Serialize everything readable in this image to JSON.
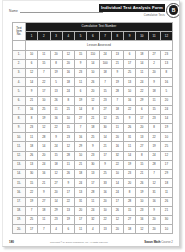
{
  "document": {
    "title": "Individual Test Analysis Form",
    "subtitle": "Cumulative Tests",
    "badge_letter": "B",
    "name_label": "Name"
  },
  "table": {
    "corner_label_line1": "Test",
    "corner_label_line2": "Item",
    "corner_label_line3": "No.",
    "group_header": "Cumulative Test Number",
    "lesson_header": "Lesson Assessed",
    "columns": [
      "1",
      "2",
      "3",
      "4",
      "5",
      "6",
      "7",
      "8",
      "9",
      "10",
      "11",
      "12"
    ],
    "rows": [
      {
        "label": "1.",
        "values": [
          "10",
          "11",
          "20",
          "12",
          "15",
          "110",
          "24",
          "13",
          "6",
          "18",
          "27",
          "23"
        ]
      },
      {
        "label": "2.",
        "values": [
          "6",
          "15",
          "8",
          "20",
          "9",
          "14",
          "100",
          "21",
          "17",
          "14",
          "2",
          "13"
        ]
      },
      {
        "label": "3.",
        "values": [
          "12",
          "7",
          "19",
          "16",
          "23",
          "10",
          "18",
          "9",
          "25",
          "11",
          "20",
          "8"
        ]
      },
      {
        "label": "4.",
        "values": [
          "14",
          "22",
          "5",
          "18",
          "11",
          "26",
          "7",
          "19",
          "13",
          "24",
          "9",
          "16"
        ]
      },
      {
        "label": "5.",
        "values": [
          "9",
          "17",
          "13",
          "24",
          "6",
          "20",
          "15",
          "28",
          "10",
          "22",
          "18",
          "5"
        ]
      },
      {
        "label": "6.",
        "values": [
          "21",
          "10",
          "26",
          "8",
          "19",
          "12",
          "23",
          "7",
          "16",
          "29",
          "11",
          "20"
        ]
      },
      {
        "label": "7.",
        "values": [
          "16",
          "25",
          "11",
          "21",
          "14",
          "8",
          "27",
          "18",
          "22",
          "6",
          "15",
          "24"
        ]
      },
      {
        "label": "8.",
        "values": [
          "8",
          "19",
          "16",
          "10",
          "27",
          "21",
          "12",
          "25",
          "9",
          "17",
          "23",
          "14"
        ]
      },
      {
        "label": "9.",
        "values": [
          "23",
          "12",
          "22",
          "15",
          "7",
          "18",
          "30",
          "11",
          "26",
          "20",
          "8",
          "19"
        ]
      },
      {
        "label": "10.",
        "values": [
          "11",
          "28",
          "9",
          "23",
          "16",
          "25",
          "14",
          "20",
          "31",
          "13",
          "22",
          "10"
        ]
      },
      {
        "label": "11.",
        "values": [
          "18",
          "14",
          "24",
          "12",
          "29",
          "9",
          "21",
          "16",
          "11",
          "27",
          "19",
          "25"
        ]
      },
      {
        "label": "12.",
        "values": [
          "26",
          "20",
          "15",
          "28",
          "10",
          "23",
          "17",
          "32",
          "14",
          "8",
          "24",
          "12"
        ]
      },
      {
        "label": "13.",
        "values": [
          "13",
          "24",
          "18",
          "11",
          "21",
          "30",
          "9",
          "22",
          "19",
          "15",
          "28",
          "17"
        ]
      },
      {
        "label": "14.",
        "values": [
          "30",
          "16",
          "12",
          "26",
          "18",
          "13",
          "25",
          "10",
          "23",
          "21",
          "7",
          "29"
        ]
      },
      {
        "label": "15.",
        "values": [
          "15",
          "21",
          "27",
          "9",
          "24",
          "17",
          "33",
          "14",
          "20",
          "26",
          "12",
          "18"
        ]
      },
      {
        "label": "16.",
        "values": [
          "22",
          "9",
          "20",
          "17",
          "13",
          "28",
          "16",
          "24",
          "8",
          "19",
          "31",
          "11"
        ]
      },
      {
        "label": "17.",
        "values": [
          "19",
          "27",
          "14",
          "22",
          "31",
          "11",
          "20",
          "17",
          "28",
          "10",
          "16",
          "26"
        ]
      },
      {
        "label": "18.",
        "values": [
          "7",
          "18",
          "29",
          "13",
          "20",
          "24",
          "10",
          "26",
          "15",
          "23",
          "9",
          "21"
        ]
      },
      {
        "label": "19.",
        "values": [
          "25",
          "11",
          "23",
          "19",
          "17",
          "32",
          "22",
          "12",
          "27",
          "16",
          "20",
          "30"
        ]
      },
      {
        "label": "20.",
        "values": [
          "17",
          "7",
          "4",
          "6",
          "11",
          "4",
          "13",
          "20",
          "18",
          "12",
          "20",
          "10"
        ]
      }
    ]
  },
  "footer": {
    "page_number": "180",
    "copyright": "Copyright © by Saxon Publishers, Inc. All rights reserved.",
    "publisher": "Saxon Math",
    "publisher_suffix": "Course 2"
  }
}
